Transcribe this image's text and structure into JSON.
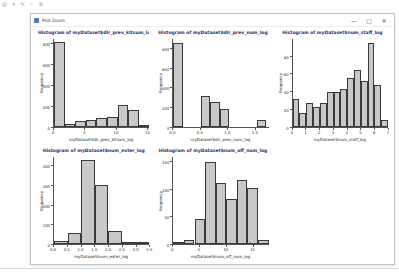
{
  "page": {
    "toolbar_fragment_glyphs": "▤ ▾ ✎ ⌗ ≣"
  },
  "window": {
    "title": "Plot Zoom",
    "controls": [
      {
        "name": "minimize",
        "glyph": "—"
      },
      {
        "name": "maximize",
        "glyph": "▢"
      },
      {
        "name": "close",
        "glyph": "✕"
      }
    ]
  },
  "colors": {
    "bar_fill": "#c8c8c8",
    "bar_border": "#3a3a3a",
    "title_text": "#2b2f77"
  },
  "chart_data": [
    {
      "type": "bar",
      "title": "Histogram of myDataset$dlr_prev_kltsum_log",
      "xlabel": "myDataset$dlr_prev_kltsum_log",
      "ylabel": "Frequency",
      "xlim": [
        0,
        15.3
      ],
      "ylim": [
        0,
        850
      ],
      "xticks": [
        "0",
        "5",
        "10",
        "15"
      ],
      "yticks": [
        0,
        200,
        400,
        600,
        800
      ],
      "grid": false,
      "bars": [
        {
          "x0": 0.0,
          "x1": 1.7,
          "h": 820
        },
        {
          "x0": 1.7,
          "x1": 3.4,
          "h": 20
        },
        {
          "x0": 3.4,
          "x1": 5.1,
          "h": 50
        },
        {
          "x0": 5.1,
          "x1": 6.8,
          "h": 62
        },
        {
          "x0": 6.8,
          "x1": 8.5,
          "h": 85
        },
        {
          "x0": 8.5,
          "x1": 10.2,
          "h": 92
        },
        {
          "x0": 10.2,
          "x1": 11.9,
          "h": 205
        },
        {
          "x0": 11.9,
          "x1": 13.6,
          "h": 160
        },
        {
          "x0": 13.6,
          "x1": 15.3,
          "h": 8
        }
      ]
    },
    {
      "type": "bar",
      "title": "Histogram of myDataset$dlr_prev_num_log",
      "xlabel": "myDataset$dlr_prev_num_log",
      "ylabel": "Frequency",
      "xlim": [
        0,
        1.75
      ],
      "ylim": [
        0,
        900
      ],
      "xticks": [
        "0.0",
        "0.5",
        "1.0",
        "1.5"
      ],
      "yticks": [
        0,
        200,
        400,
        600,
        800
      ],
      "grid": false,
      "bars": [
        {
          "x0": 0.0,
          "x1": 0.17,
          "h": 860
        },
        {
          "x0": 0.51,
          "x1": 0.68,
          "h": 310
        },
        {
          "x0": 0.68,
          "x1": 0.85,
          "h": 255
        },
        {
          "x0": 0.85,
          "x1": 1.02,
          "h": 185
        },
        {
          "x0": 1.53,
          "x1": 1.7,
          "h": 70
        }
      ]
    },
    {
      "type": "bar",
      "title": "Histogram of myDataset$num_staff_log",
      "xlabel": "myDataset$num_staff_log",
      "ylabel": "Frequency",
      "xlim": [
        0,
        7
      ],
      "ylim": [
        0,
        100
      ],
      "xticks": [
        "0",
        "1",
        "2",
        "3",
        "4",
        "5",
        "6",
        "7"
      ],
      "yticks": [
        0,
        20,
        40,
        60,
        80
      ],
      "grid": false,
      "bars": [
        {
          "x0": 0.0,
          "x1": 0.5,
          "h": 32
        },
        {
          "x0": 0.5,
          "x1": 1.0,
          "h": 15
        },
        {
          "x0": 1.0,
          "x1": 1.5,
          "h": 27
        },
        {
          "x0": 1.5,
          "x1": 2.0,
          "h": 22
        },
        {
          "x0": 2.0,
          "x1": 2.5,
          "h": 27
        },
        {
          "x0": 2.5,
          "x1": 3.0,
          "h": 40
        },
        {
          "x0": 3.0,
          "x1": 3.5,
          "h": 40
        },
        {
          "x0": 3.5,
          "x1": 4.0,
          "h": 43
        },
        {
          "x0": 4.0,
          "x1": 4.5,
          "h": 55
        },
        {
          "x0": 4.5,
          "x1": 5.0,
          "h": 65
        },
        {
          "x0": 5.0,
          "x1": 5.5,
          "h": 52
        },
        {
          "x0": 5.5,
          "x1": 6.0,
          "h": 95
        },
        {
          "x0": 6.0,
          "x1": 6.5,
          "h": 48
        },
        {
          "x0": 6.5,
          "x1": 7.0,
          "h": 8
        }
      ]
    },
    {
      "type": "bar",
      "title": "Histogram of myDataset$num_exter_log",
      "xlabel": "myDataset$num_exter_log",
      "ylabel": "Frequency",
      "xlim": [
        0,
        3.5
      ],
      "ylim": [
        0,
        450
      ],
      "xticks": [
        "0.0",
        "0.5",
        "1.0",
        "1.5",
        "2.0",
        "2.5",
        "3.0",
        "3.5"
      ],
      "yticks": [
        0,
        100,
        200,
        300,
        400
      ],
      "grid": false,
      "bars": [
        {
          "x0": 0.0,
          "x1": 0.5,
          "h": 15
        },
        {
          "x0": 0.5,
          "x1": 1.0,
          "h": 55
        },
        {
          "x0": 1.0,
          "x1": 1.5,
          "h": 430
        },
        {
          "x0": 1.5,
          "x1": 2.0,
          "h": 305
        },
        {
          "x0": 2.0,
          "x1": 2.5,
          "h": 65
        },
        {
          "x0": 2.5,
          "x1": 3.0,
          "h": 8
        },
        {
          "x0": 3.0,
          "x1": 3.5,
          "h": 8
        }
      ]
    },
    {
      "type": "bar",
      "title": "Histogram of myDataset$num_off_num_log",
      "xlabel": "myDataset$num_off_num_log",
      "ylabel": "Frequency",
      "xlim": [
        0,
        18
      ],
      "ylim": [
        0,
        160
      ],
      "xticks": [
        "0",
        "5",
        "10",
        "15"
      ],
      "yticks": [
        0,
        50,
        100,
        150
      ],
      "grid": false,
      "bars": [
        {
          "x0": 0,
          "x1": 2,
          "h": 4
        },
        {
          "x0": 2,
          "x1": 4,
          "h": 7
        },
        {
          "x0": 4,
          "x1": 6,
          "h": 46
        },
        {
          "x0": 6,
          "x1": 8,
          "h": 150
        },
        {
          "x0": 8,
          "x1": 10,
          "h": 112
        },
        {
          "x0": 10,
          "x1": 12,
          "h": 82
        },
        {
          "x0": 12,
          "x1": 14,
          "h": 117
        },
        {
          "x0": 14,
          "x1": 16,
          "h": 102
        },
        {
          "x0": 16,
          "x1": 18,
          "h": 8
        }
      ]
    }
  ]
}
